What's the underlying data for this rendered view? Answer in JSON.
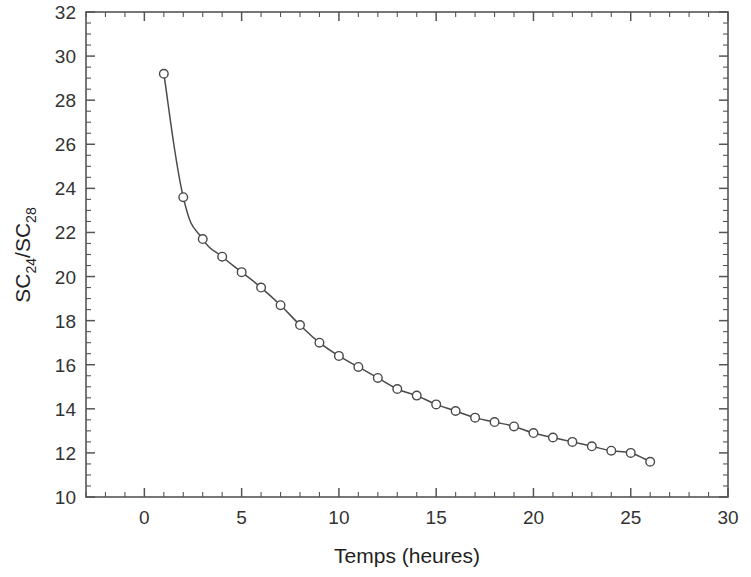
{
  "chart_data": {
    "type": "line",
    "title": "",
    "xlabel": "Temps (heures)",
    "ylabel": "SC24/SC28",
    "ylabel_parts": {
      "base1": "SC",
      "sub1": "24",
      "slash": "/",
      "base2": "SC",
      "sub2": "28"
    },
    "xlim": [
      -3,
      30
    ],
    "ylim": [
      10,
      32
    ],
    "xticks": [
      0,
      5,
      10,
      15,
      20,
      25,
      30
    ],
    "xtick_labels": [
      "0",
      "5",
      "10",
      "15",
      "20",
      "25",
      "30"
    ],
    "x_minor_step": 1,
    "yticks": [
      10,
      12,
      14,
      16,
      18,
      20,
      22,
      24,
      26,
      28,
      30,
      32
    ],
    "ytick_labels": [
      "10",
      "12",
      "14",
      "16",
      "18",
      "20",
      "22",
      "24",
      "26",
      "28",
      "30",
      "32"
    ],
    "y_minor_step": 0.5,
    "grid": false,
    "legend": null,
    "frame": true,
    "tick_direction": "in",
    "marker": "open-circle",
    "line_color": "#4a4a4a",
    "marker_edge_color": "#4a4a4a",
    "marker_face_color": "#ffffff",
    "axis_color": "#555555",
    "background": "#ffffff",
    "x": [
      1,
      2,
      3,
      4,
      5,
      6,
      7,
      8,
      9,
      10,
      11,
      12,
      13,
      14,
      15,
      16,
      17,
      18,
      19,
      20,
      21,
      22,
      23,
      24,
      25,
      26
    ],
    "values": [
      29.2,
      23.6,
      21.7,
      20.9,
      20.2,
      19.5,
      18.7,
      17.8,
      17.0,
      16.4,
      15.9,
      15.4,
      14.9,
      14.6,
      14.2,
      13.9,
      13.6,
      13.4,
      13.2,
      12.9,
      12.7,
      12.5,
      12.3,
      12.1,
      12.0,
      11.6
    ],
    "series": [
      {
        "name": "SC24/SC28",
        "x": [
          1,
          2,
          3,
          4,
          5,
          6,
          7,
          8,
          9,
          10,
          11,
          12,
          13,
          14,
          15,
          16,
          17,
          18,
          19,
          20,
          21,
          22,
          23,
          24,
          25,
          26
        ],
        "values": [
          29.2,
          23.6,
          21.7,
          20.9,
          20.2,
          19.5,
          18.7,
          17.8,
          17.0,
          16.4,
          15.9,
          15.4,
          14.9,
          14.6,
          14.2,
          13.9,
          13.6,
          13.4,
          13.2,
          12.9,
          12.7,
          12.5,
          12.3,
          12.1,
          12.0,
          11.6
        ]
      }
    ]
  }
}
